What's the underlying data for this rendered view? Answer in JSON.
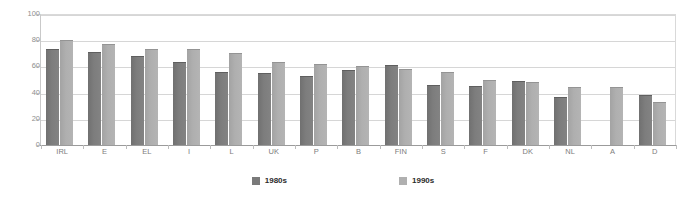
{
  "chart_data": {
    "type": "bar",
    "title": "",
    "xlabel": "",
    "ylabel": "",
    "ylim": [
      0,
      100
    ],
    "yticks": [
      0,
      20,
      40,
      60,
      80,
      100
    ],
    "grid": true,
    "legend_position": "bottom-center",
    "categories": [
      "IRL",
      "E",
      "EL",
      "I",
      "L",
      "UK",
      "P",
      "B",
      "FIN",
      "S",
      "F",
      "DK",
      "NL",
      "A",
      "D"
    ],
    "series": [
      {
        "name": "1980s",
        "color": "#7a7a7a",
        "values": [
          73,
          71,
          68,
          63,
          56,
          55,
          53,
          57,
          61,
          46,
          45,
          49,
          37,
          null,
          38
        ]
      },
      {
        "name": "1990s",
        "color": "#b0b0b0",
        "values": [
          80,
          77,
          73,
          73,
          70,
          63,
          62,
          60,
          58,
          56,
          50,
          48,
          44,
          44,
          33
        ]
      }
    ]
  },
  "legend": {
    "items": [
      {
        "label": "1980s"
      },
      {
        "label": "1990s"
      }
    ]
  }
}
